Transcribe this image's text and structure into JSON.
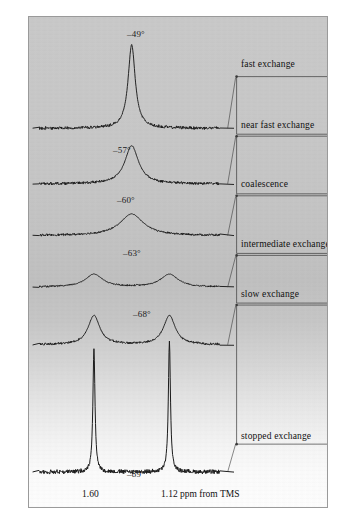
{
  "figure": {
    "background_top_color": "#c9c9c9",
    "background_bottom_color": "#fdfdfd",
    "frame_color": "#9a9a9a",
    "trace_color": "#1a1a1a",
    "bracket_color": "#3a3a3a"
  },
  "spectra": [
    {
      "temperature_label": "–49°",
      "regime": "fast exchange"
    },
    {
      "temperature_label": "–57°",
      "regime": "near fast exchange"
    },
    {
      "temperature_label": "–60°",
      "regime": "coalescence"
    },
    {
      "temperature_label": "–63°",
      "regime": "intermediate exchange"
    },
    {
      "temperature_label": "–68°",
      "regime": "slow exchange"
    },
    {
      "temperature_label": "–89°",
      "regime": "stopped exchange"
    }
  ],
  "regime_brackets": [
    {
      "label": "fast exchange"
    },
    {
      "label": "near fast exchange"
    },
    {
      "label": "coalescence"
    },
    {
      "label": "intermediate exchange"
    },
    {
      "label": "slow exchange"
    },
    {
      "label": "stopped exchange"
    }
  ],
  "axis": {
    "left_shift_label": "1.60",
    "right_shift_label": "1.12 ppm from TMS"
  },
  "chart_data": {
    "type": "line",
    "title": "",
    "xlabel": "ppm from TMS",
    "ylabel": "",
    "grid": false,
    "legend": "none",
    "xlim": [
      1.95,
      0.8
    ],
    "x_tick_values": [
      1.6,
      1.12
    ],
    "x_tick_labels": [
      "1.60",
      "1.12 ppm from TMS"
    ],
    "peak_positions_ppm": [
      1.6,
      1.12
    ],
    "series": [
      {
        "name": "–49°",
        "temperature_c": -49,
        "regime": "fast exchange",
        "peaks": [
          {
            "center_ppm": 1.36,
            "height": 1.0,
            "width_ppm": 0.055
          }
        ]
      },
      {
        "name": "–57°",
        "temperature_c": -57,
        "regime": "near fast exchange",
        "peaks": [
          {
            "center_ppm": 1.36,
            "height": 0.52,
            "width_ppm": 0.105
          }
        ]
      },
      {
        "name": "–60°",
        "temperature_c": -60,
        "regime": "coalescence",
        "peaks": [
          {
            "center_ppm": 1.36,
            "height": 0.34,
            "width_ppm": 0.18
          }
        ]
      },
      {
        "name": "–63°",
        "temperature_c": -63,
        "regime": "intermediate exchange",
        "peaks": [
          {
            "center_ppm": 1.6,
            "height": 0.26,
            "width_ppm": 0.135
          },
          {
            "center_ppm": 1.12,
            "height": 0.26,
            "width_ppm": 0.135
          }
        ]
      },
      {
        "name": "–68°",
        "temperature_c": -68,
        "regime": "slow exchange",
        "peaks": [
          {
            "center_ppm": 1.6,
            "height": 0.42,
            "width_ppm": 0.09
          },
          {
            "center_ppm": 1.12,
            "height": 0.42,
            "width_ppm": 0.09
          }
        ]
      },
      {
        "name": "–89°",
        "temperature_c": -89,
        "regime": "stopped exchange",
        "peaks": [
          {
            "center_ppm": 1.6,
            "height": 1.05,
            "width_ppm": 0.016
          },
          {
            "center_ppm": 1.12,
            "height": 1.12,
            "width_ppm": 0.016
          }
        ]
      }
    ]
  }
}
